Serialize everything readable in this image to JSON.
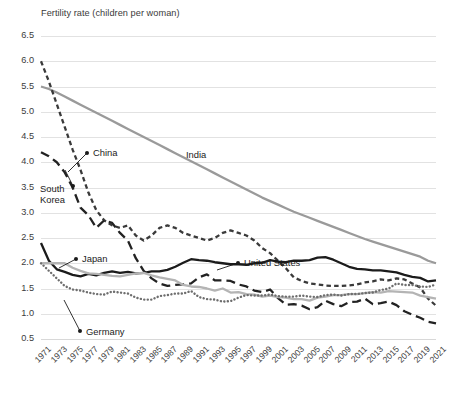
{
  "chart_data": {
    "type": "line",
    "title": "",
    "axis_title": "Fertility rate (children per woman)",
    "xlabel": "",
    "ylabel": "Fertility rate (children per woman)",
    "ylim": [
      0.5,
      6.5
    ],
    "ytick_step": 0.5,
    "yticks": [
      "6.5",
      "6.0",
      "5.5",
      "5.0",
      "4.5",
      "4.0",
      "3.5",
      "3.0",
      "2.5",
      "2.0",
      "1.5",
      "1.0",
      "0.5"
    ],
    "xlim": [
      1971,
      2021
    ],
    "xticks": [
      "1971",
      "1973",
      "1975",
      "1977",
      "1979",
      "1981",
      "1983",
      "1985",
      "1987",
      "1989",
      "1991",
      "1993",
      "1995",
      "1997",
      "1999",
      "2001",
      "2003",
      "2005",
      "2007",
      "2009",
      "2011",
      "2013",
      "2015",
      "2017",
      "2019",
      "2021"
    ],
    "x": [
      1971,
      1972,
      1973,
      1974,
      1975,
      1976,
      1977,
      1978,
      1979,
      1980,
      1981,
      1982,
      1983,
      1984,
      1985,
      1986,
      1987,
      1988,
      1989,
      1990,
      1991,
      1992,
      1993,
      1994,
      1995,
      1996,
      1997,
      1998,
      1999,
      2000,
      2001,
      2002,
      2003,
      2004,
      2005,
      2006,
      2007,
      2008,
      2009,
      2010,
      2011,
      2012,
      2013,
      2014,
      2015,
      2016,
      2017,
      2018,
      2019,
      2020,
      2021
    ],
    "grid": true,
    "legend_position": "inline-labels",
    "series": [
      {
        "name": "India",
        "style": "solid",
        "color": "#9a9a9a",
        "width": 2.3,
        "values": [
          5.5,
          5.45,
          5.38,
          5.3,
          5.22,
          5.14,
          5.06,
          4.98,
          4.9,
          4.82,
          4.74,
          4.66,
          4.58,
          4.5,
          4.42,
          4.34,
          4.26,
          4.18,
          4.1,
          4.02,
          3.94,
          3.86,
          3.78,
          3.7,
          3.62,
          3.54,
          3.46,
          3.38,
          3.3,
          3.23,
          3.16,
          3.09,
          3.02,
          2.96,
          2.9,
          2.84,
          2.78,
          2.72,
          2.66,
          2.6,
          2.54,
          2.48,
          2.43,
          2.38,
          2.33,
          2.28,
          2.23,
          2.18,
          2.13,
          2.05,
          2.0
        ]
      },
      {
        "name": "China",
        "style": "short-dash",
        "color": "#3a3a3a",
        "width": 2.3,
        "values": [
          6.0,
          5.6,
          5.15,
          4.7,
          4.25,
          3.85,
          3.4,
          3.05,
          2.85,
          2.75,
          2.7,
          2.75,
          2.55,
          2.45,
          2.55,
          2.7,
          2.75,
          2.7,
          2.6,
          2.55,
          2.5,
          2.45,
          2.5,
          2.6,
          2.65,
          2.6,
          2.55,
          2.45,
          2.3,
          2.2,
          2.05,
          1.9,
          1.72,
          1.65,
          1.6,
          1.58,
          1.56,
          1.55,
          1.55,
          1.56,
          1.58,
          1.62,
          1.64,
          1.68,
          1.66,
          1.7,
          1.68,
          1.6,
          1.52,
          1.3,
          1.16
        ]
      },
      {
        "name": "South Korea",
        "style": "long-dash",
        "color": "#222222",
        "width": 2.3,
        "values": [
          4.2,
          4.12,
          4.0,
          3.8,
          3.5,
          3.1,
          2.95,
          2.7,
          2.85,
          2.8,
          2.6,
          2.45,
          2.1,
          1.85,
          1.7,
          1.6,
          1.55,
          1.57,
          1.58,
          1.6,
          1.72,
          1.78,
          1.66,
          1.66,
          1.65,
          1.58,
          1.54,
          1.46,
          1.43,
          1.48,
          1.31,
          1.18,
          1.19,
          1.16,
          1.09,
          1.13,
          1.26,
          1.19,
          1.15,
          1.23,
          1.24,
          1.3,
          1.19,
          1.21,
          1.24,
          1.17,
          1.05,
          0.98,
          0.92,
          0.84,
          0.81
        ]
      },
      {
        "name": "United States",
        "style": "solid",
        "color": "#1b1b1b",
        "width": 2.3,
        "values": [
          2.4,
          2.05,
          1.88,
          1.83,
          1.77,
          1.74,
          1.79,
          1.76,
          1.81,
          1.84,
          1.81,
          1.83,
          1.8,
          1.81,
          1.84,
          1.84,
          1.87,
          1.93,
          2.01,
          2.08,
          2.06,
          2.05,
          2.02,
          2.0,
          1.98,
          1.98,
          1.97,
          2.0,
          2.01,
          2.06,
          2.03,
          2.02,
          2.05,
          2.05,
          2.06,
          2.11,
          2.12,
          2.07,
          2.0,
          1.93,
          1.89,
          1.88,
          1.86,
          1.86,
          1.84,
          1.82,
          1.77,
          1.73,
          1.71,
          1.64,
          1.66
        ]
      },
      {
        "name": "Japan",
        "style": "solid",
        "color": "#b4b4b4",
        "width": 2.3,
        "values": [
          2.0,
          2.0,
          2.0,
          2.0,
          1.91,
          1.85,
          1.8,
          1.79,
          1.77,
          1.75,
          1.74,
          1.77,
          1.8,
          1.81,
          1.76,
          1.72,
          1.69,
          1.66,
          1.57,
          1.54,
          1.53,
          1.5,
          1.46,
          1.5,
          1.42,
          1.43,
          1.39,
          1.38,
          1.34,
          1.36,
          1.33,
          1.32,
          1.29,
          1.29,
          1.26,
          1.32,
          1.34,
          1.37,
          1.37,
          1.39,
          1.39,
          1.41,
          1.43,
          1.42,
          1.45,
          1.44,
          1.43,
          1.42,
          1.36,
          1.33,
          1.3
        ]
      },
      {
        "name": "Germany",
        "style": "dotted",
        "color": "#6e6e6e",
        "width": 2.4,
        "values": [
          2.0,
          1.85,
          1.7,
          1.55,
          1.48,
          1.46,
          1.42,
          1.39,
          1.38,
          1.44,
          1.42,
          1.4,
          1.32,
          1.28,
          1.28,
          1.35,
          1.37,
          1.4,
          1.4,
          1.45,
          1.33,
          1.29,
          1.28,
          1.24,
          1.25,
          1.32,
          1.37,
          1.36,
          1.36,
          1.38,
          1.35,
          1.34,
          1.34,
          1.36,
          1.34,
          1.33,
          1.37,
          1.38,
          1.36,
          1.39,
          1.39,
          1.41,
          1.42,
          1.47,
          1.5,
          1.6,
          1.57,
          1.57,
          1.54,
          1.53,
          1.58
        ]
      }
    ],
    "annotations": [
      {
        "name": "China",
        "label": "China",
        "label_x": 93,
        "label_y": 148,
        "dot_x": 87,
        "dot_y": 153,
        "anchor_x": 68,
        "anchor_y": 172
      },
      {
        "name": "India",
        "label": "India",
        "label_x": 186,
        "label_y": 150
      },
      {
        "name": "South Korea",
        "label_line1": "South",
        "label_line2": "Korea",
        "label_x": 40,
        "label_y": 184,
        "dot_x": 73,
        "dot_y": 186,
        "anchor_x": 65,
        "anchor_y": 170
      },
      {
        "name": "Japan",
        "label": "Japan",
        "label_x": 82,
        "label_y": 254,
        "dot_x": 76,
        "dot_y": 259,
        "anchor_x": 59,
        "anchor_y": 268
      },
      {
        "name": "United States",
        "label": "United States",
        "label_x": 244,
        "label_y": 258,
        "dot_x": 238,
        "dot_y": 263,
        "anchor_x": 217,
        "anchor_y": 270
      },
      {
        "name": "Germany",
        "label": "Germany",
        "label_x": 86,
        "label_y": 327,
        "dot_x": 80,
        "dot_y": 331,
        "anchor_x": 64,
        "anchor_y": 300
      }
    ]
  }
}
